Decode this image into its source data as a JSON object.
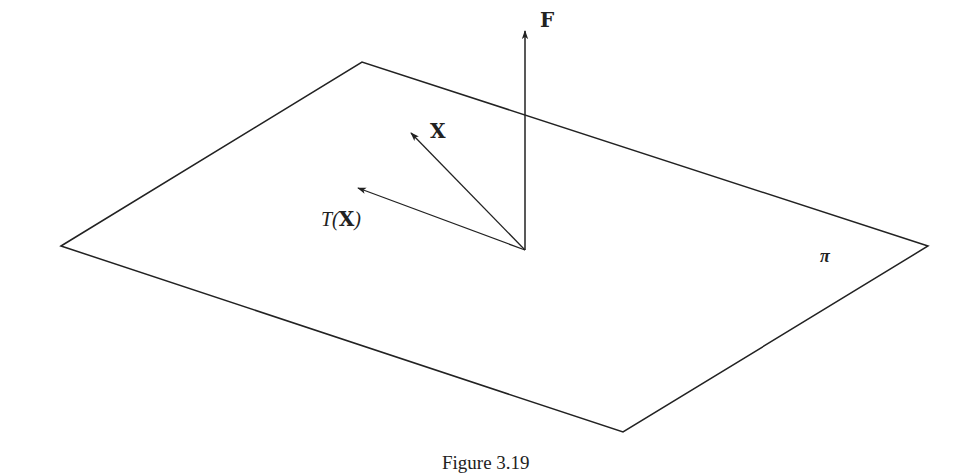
{
  "figure": {
    "caption": "Figure 3.19",
    "plane": {
      "label": "π",
      "corners": {
        "left": [
          61,
          246
        ],
        "top": [
          362,
          62
        ],
        "right": [
          928,
          246
        ],
        "bottom": [
          623,
          432
        ]
      },
      "stroke": "#222222"
    },
    "origin": [
      525,
      250
    ],
    "vectors": [
      {
        "name": "F",
        "label": "F",
        "tip": [
          525,
          30
        ]
      },
      {
        "name": "X",
        "label": "X",
        "tip": [
          411,
          133
        ]
      },
      {
        "name": "T(X)",
        "label_prefix": "T(",
        "label_bold": "X",
        "label_suffix": ")",
        "tip": [
          357,
          188
        ]
      }
    ]
  }
}
